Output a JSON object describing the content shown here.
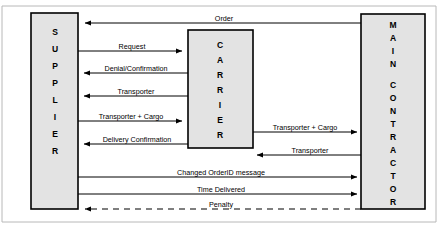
{
  "diagram": {
    "type": "sequence-flow",
    "colors": {
      "actor_fill": "#e3e3e3",
      "actor_stroke": "#000000",
      "line": "#000000",
      "background": "#ffffff"
    },
    "actors": [
      {
        "id": "supplier",
        "label": "SUPPLIER",
        "letters": [
          "S",
          "U",
          "P",
          "P",
          "L",
          "I",
          "E",
          "R"
        ],
        "position": "left"
      },
      {
        "id": "carrier",
        "label": "CARRIER",
        "letters": [
          "C",
          "A",
          "R",
          "R",
          "I",
          "E",
          "R"
        ],
        "position": "center"
      },
      {
        "id": "main_contractor",
        "label": "MAIN CONTRACTOR",
        "letters": [
          "M",
          "A",
          "I",
          "N",
          "",
          "C",
          "O",
          "N",
          "T",
          "R",
          "A",
          "C",
          "T",
          "O",
          "R"
        ],
        "position": "right"
      }
    ],
    "messages": [
      {
        "id": "m1",
        "label": "Order",
        "from": "main_contractor",
        "to": "supplier",
        "style": "solid",
        "direction": "left"
      },
      {
        "id": "m2",
        "label": "Request",
        "from": "supplier",
        "to": "carrier",
        "style": "solid",
        "direction": "right"
      },
      {
        "id": "m3",
        "label": "Denial/Confirmation",
        "from": "carrier",
        "to": "supplier",
        "style": "solid",
        "direction": "left"
      },
      {
        "id": "m4",
        "label": "Transporter",
        "from": "carrier",
        "to": "supplier",
        "style": "solid",
        "direction": "left"
      },
      {
        "id": "m5",
        "label": "Transporter + Cargo",
        "from": "supplier",
        "to": "carrier",
        "style": "solid",
        "direction": "right"
      },
      {
        "id": "m6",
        "label": "Delivery Confirmation",
        "from": "carrier",
        "to": "supplier",
        "style": "solid",
        "direction": "left"
      },
      {
        "id": "m7",
        "label": "Transporter + Cargo",
        "from": "carrier",
        "to": "main_contractor",
        "style": "solid",
        "direction": "right"
      },
      {
        "id": "m8",
        "label": "Transporter",
        "from": "main_contractor",
        "to": "carrier",
        "style": "solid",
        "direction": "left"
      },
      {
        "id": "m9",
        "label": "Changed OrderID message",
        "from": "supplier",
        "to": "main_contractor",
        "style": "solid",
        "direction": "right"
      },
      {
        "id": "m10",
        "label": "Time Delivered",
        "from": "supplier",
        "to": "main_contractor",
        "style": "solid",
        "direction": "right"
      },
      {
        "id": "m11",
        "label": "Penalty",
        "from": "main_contractor",
        "to": "supplier",
        "style": "dashed",
        "direction": "left"
      }
    ]
  }
}
